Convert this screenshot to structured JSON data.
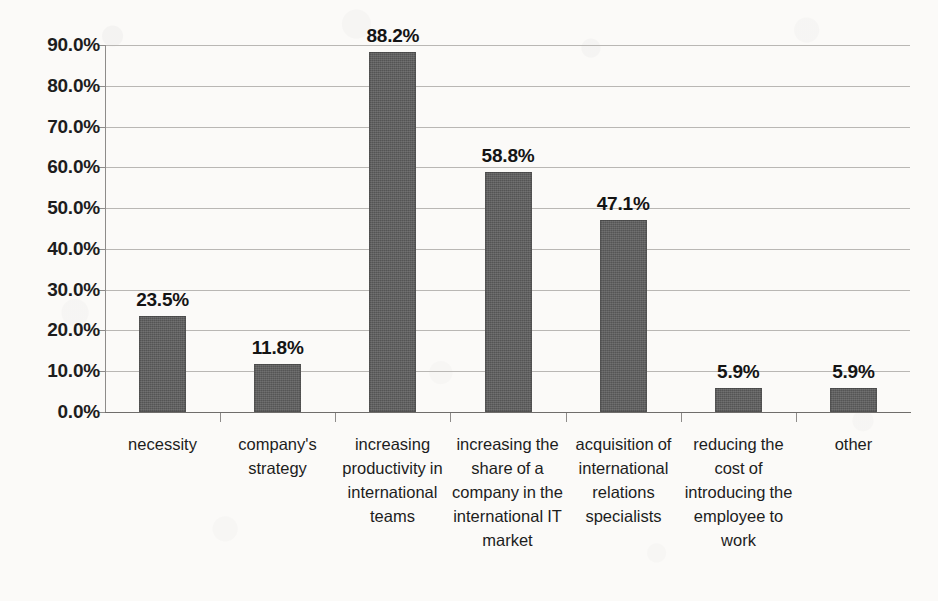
{
  "chart_data": {
    "type": "bar",
    "title": "",
    "subtitle": "",
    "xlabel": "",
    "ylabel": "",
    "ylim": [
      0,
      90
    ],
    "y_tick_labels": [
      "0.0%",
      "10.0%",
      "20.0%",
      "30.0%",
      "40.0%",
      "50.0%",
      "60.0%",
      "70.0%",
      "80.0%",
      "90.0%"
    ],
    "y_tick_values": [
      0,
      10,
      20,
      30,
      40,
      50,
      60,
      70,
      80,
      90
    ],
    "grid": true,
    "legend": false,
    "legend_position": "none",
    "categories": [
      "necessity",
      "company's strategy",
      "increasing productivity in international teams",
      "increasing the share of a company in the international IT market",
      "acquisition of international relations specialists",
      "reducing the cost of introducing the employee to work",
      "other"
    ],
    "values": [
      23.5,
      11.8,
      88.2,
      58.8,
      47.1,
      5.9,
      5.9
    ],
    "data_labels": [
      "23.5%",
      "11.8%",
      "88.2%",
      "58.8%",
      "47.1%",
      "5.9%",
      "5.9%"
    ],
    "bar_color": "#5d5d5d",
    "background_color": "#fbfaf8",
    "gridline_color": "#b9b7b4"
  }
}
